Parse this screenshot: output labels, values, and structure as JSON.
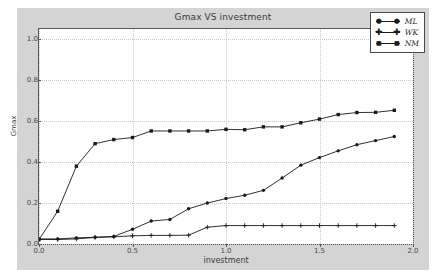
{
  "chart_data": {
    "type": "line",
    "title": "Gmax VS investment",
    "xlabel": "investment",
    "ylabel": "Gmax",
    "xlim": [
      0.0,
      2.0
    ],
    "ylim": [
      0.0,
      1.05
    ],
    "grid": true,
    "legend_position": "top-right",
    "xticks": [
      "0.0",
      "0.5",
      "1.0",
      "1.5",
      "2.0"
    ],
    "xtick_values": [
      0.0,
      0.5,
      1.0,
      1.5,
      2.0
    ],
    "yticks": [
      "0.0",
      "0.2",
      "0.4",
      "0.6",
      "0.8",
      "1.0"
    ],
    "ytick_values": [
      0.0,
      0.2,
      0.4,
      0.6,
      0.8,
      1.0
    ],
    "x": [
      0.0,
      0.1,
      0.2,
      0.3,
      0.4,
      0.5,
      0.6,
      0.7,
      0.8,
      0.9,
      1.0,
      1.1,
      1.2,
      1.3,
      1.4,
      1.5,
      1.6,
      1.7,
      1.8,
      1.9
    ],
    "series": [
      {
        "name": "ML",
        "marker": "circle",
        "color": "#1a1a1a",
        "values": [
          0.025,
          0.025,
          0.03,
          0.033,
          0.037,
          0.072,
          0.112,
          0.12,
          0.172,
          0.2,
          0.222,
          0.238,
          0.262,
          0.322,
          0.385,
          0.422,
          0.455,
          0.485,
          0.505,
          0.525
        ]
      },
      {
        "name": "WK",
        "marker": "plus",
        "color": "#1a1a1a",
        "values": [
          0.022,
          0.022,
          0.025,
          0.032,
          0.035,
          0.04,
          0.042,
          0.042,
          0.043,
          0.082,
          0.09,
          0.09,
          0.09,
          0.09,
          0.09,
          0.09,
          0.09,
          0.09,
          0.09,
          0.09
        ]
      },
      {
        "name": "NM",
        "marker": "square",
        "color": "#1a1a1a",
        "values": [
          0.022,
          0.16,
          0.38,
          0.49,
          0.51,
          0.52,
          0.552,
          0.552,
          0.552,
          0.552,
          0.56,
          0.558,
          0.572,
          0.572,
          0.592,
          0.61,
          0.632,
          0.642,
          0.643,
          0.653
        ]
      }
    ]
  },
  "legend": {
    "entries": [
      {
        "label": "ML"
      },
      {
        "label": "WK"
      },
      {
        "label": "NM"
      }
    ]
  }
}
